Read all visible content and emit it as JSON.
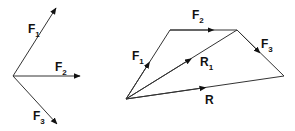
{
  "diagram": {
    "left": {
      "title": "Force vectors from a common point",
      "vectors": [
        {
          "name": "F",
          "sub": "1"
        },
        {
          "name": "F",
          "sub": "2"
        },
        {
          "name": "F",
          "sub": "3"
        }
      ]
    },
    "right": {
      "title": "Polygon of forces",
      "vectors": [
        {
          "name": "F",
          "sub": "1"
        },
        {
          "name": "F",
          "sub": "2"
        },
        {
          "name": "F",
          "sub": "3"
        },
        {
          "name": "R",
          "sub": "1"
        },
        {
          "name": "R",
          "sub": ""
        }
      ]
    },
    "colors": {
      "line": "#333333",
      "text": "#111111",
      "background": "#ffffff"
    }
  }
}
